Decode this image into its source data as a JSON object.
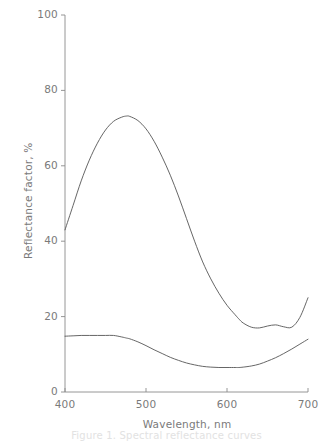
{
  "chart_data": {
    "type": "line",
    "title": "",
    "xlabel": "Wavelength, nm",
    "ylabel": "Reflectance factor, %",
    "xlim": [
      400,
      700
    ],
    "ylim": [
      0,
      100
    ],
    "xticks": [
      400,
      500,
      600,
      700
    ],
    "yticks": [
      0,
      20,
      40,
      60,
      80,
      100
    ],
    "xticklabels": [
      "400",
      "500",
      "600",
      "700"
    ],
    "yticklabels": [
      "0",
      "20",
      "40",
      "60",
      "80",
      "100"
    ],
    "grid": false,
    "legend": false,
    "x": [
      400,
      410,
      420,
      430,
      440,
      450,
      460,
      470,
      476,
      480,
      490,
      500,
      510,
      520,
      530,
      540,
      550,
      560,
      570,
      580,
      590,
      600,
      610,
      615,
      620,
      630,
      640,
      650,
      660,
      670,
      680,
      690,
      700
    ],
    "series": [
      {
        "name": "upper-curve",
        "values": [
          43.0,
          49.5,
          56.0,
          61.5,
          66.0,
          69.5,
          71.8,
          72.9,
          73.2,
          73.1,
          72.0,
          69.8,
          66.5,
          62.3,
          57.5,
          52.0,
          46.0,
          40.0,
          34.5,
          30.0,
          26.2,
          23.0,
          20.5,
          19.3,
          18.3,
          17.2,
          17.0,
          17.5,
          17.8,
          17.3,
          17.2,
          19.8,
          25.0
        ]
      },
      {
        "name": "lower-curve",
        "values": [
          14.8,
          14.9,
          15.0,
          15.0,
          15.0,
          15.0,
          15.0,
          14.6,
          14.3,
          14.1,
          13.3,
          12.3,
          11.2,
          10.2,
          9.2,
          8.4,
          7.7,
          7.2,
          6.8,
          6.6,
          6.5,
          6.5,
          6.5,
          6.5,
          6.6,
          6.9,
          7.4,
          8.2,
          9.1,
          10.2,
          11.4,
          12.7,
          14.0
        ]
      }
    ],
    "line_color": "#555555",
    "axis_color": "#888888",
    "text_color": "#7a7a7a"
  },
  "caption": {
    "text": "Figure 1. Spectral reflectance curves"
  }
}
